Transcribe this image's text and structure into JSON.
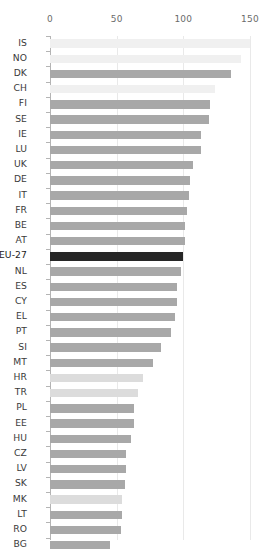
{
  "chart_data": {
    "type": "bar",
    "orientation": "horizontal",
    "title": "",
    "subtitle": "",
    "xlabel": "",
    "ylabel": "",
    "xlim": [
      0,
      150
    ],
    "ylim": null,
    "xticks": [
      0,
      50,
      100,
      150
    ],
    "xtick_labels": [
      "0",
      "50",
      "100",
      "150"
    ],
    "grid": true,
    "grid_axis": "x",
    "legend": null,
    "legend_position": "none",
    "highlight_category": "EU-27",
    "baseline_value": 100,
    "colors": {
      "bar_default": "#a8a8a8",
      "bar_highlight": "#262626",
      "bar_light": "#f0f0f0",
      "bar_candidate": "#dcdcdc",
      "grid": "#e9e9e9",
      "axis": "#b4b4b4",
      "label_text": "#3a3a3a",
      "tick_text": "#6b6b6b",
      "background": "#ffffff"
    },
    "categories": [
      "IS",
      "NO",
      "DK",
      "CH",
      "FI",
      "SE",
      "IE",
      "LU",
      "UK",
      "DE",
      "IT",
      "FR",
      "BE",
      "AT",
      "EU-27",
      "NL",
      "ES",
      "CY",
      "EL",
      "PT",
      "SI",
      "MT",
      "HR",
      "TR",
      "PL",
      "EE",
      "HU",
      "CZ",
      "LV",
      "SK",
      "MK",
      "LT",
      "RO",
      "BG"
    ],
    "values": [
      150,
      143,
      136,
      124,
      120,
      119,
      113,
      113,
      107,
      105,
      104,
      103,
      101,
      101,
      100,
      98,
      95,
      95,
      94,
      91,
      83,
      77,
      70,
      66,
      63,
      63,
      61,
      57,
      57,
      56,
      54,
      54,
      53,
      45
    ],
    "bars": [
      {
        "category": "IS",
        "value": 150,
        "style": "light"
      },
      {
        "category": "NO",
        "value": 143,
        "style": "light"
      },
      {
        "category": "DK",
        "value": 136,
        "style": "default"
      },
      {
        "category": "CH",
        "value": 124,
        "style": "light"
      },
      {
        "category": "FI",
        "value": 120,
        "style": "default"
      },
      {
        "category": "SE",
        "value": 119,
        "style": "default"
      },
      {
        "category": "IE",
        "value": 113,
        "style": "default"
      },
      {
        "category": "LU",
        "value": 113,
        "style": "default"
      },
      {
        "category": "UK",
        "value": 107,
        "style": "default"
      },
      {
        "category": "DE",
        "value": 105,
        "style": "default"
      },
      {
        "category": "IT",
        "value": 104,
        "style": "default"
      },
      {
        "category": "FR",
        "value": 103,
        "style": "default"
      },
      {
        "category": "BE",
        "value": 101,
        "style": "default"
      },
      {
        "category": "AT",
        "value": 101,
        "style": "default"
      },
      {
        "category": "EU-27",
        "value": 100,
        "style": "highlight"
      },
      {
        "category": "NL",
        "value": 98,
        "style": "default"
      },
      {
        "category": "ES",
        "value": 95,
        "style": "default"
      },
      {
        "category": "CY",
        "value": 95,
        "style": "default"
      },
      {
        "category": "EL",
        "value": 94,
        "style": "default"
      },
      {
        "category": "PT",
        "value": 91,
        "style": "default"
      },
      {
        "category": "SI",
        "value": 83,
        "style": "default"
      },
      {
        "category": "MT",
        "value": 77,
        "style": "default"
      },
      {
        "category": "HR",
        "value": 70,
        "style": "candidate"
      },
      {
        "category": "TR",
        "value": 66,
        "style": "candidate"
      },
      {
        "category": "PL",
        "value": 63,
        "style": "default"
      },
      {
        "category": "EE",
        "value": 63,
        "style": "default"
      },
      {
        "category": "HU",
        "value": 61,
        "style": "default"
      },
      {
        "category": "CZ",
        "value": 57,
        "style": "default"
      },
      {
        "category": "LV",
        "value": 57,
        "style": "default"
      },
      {
        "category": "SK",
        "value": 56,
        "style": "default"
      },
      {
        "category": "MK",
        "value": 54,
        "style": "candidate"
      },
      {
        "category": "LT",
        "value": 54,
        "style": "default"
      },
      {
        "category": "RO",
        "value": 53,
        "style": "default"
      },
      {
        "category": "BG",
        "value": 45,
        "style": "default"
      }
    ]
  }
}
